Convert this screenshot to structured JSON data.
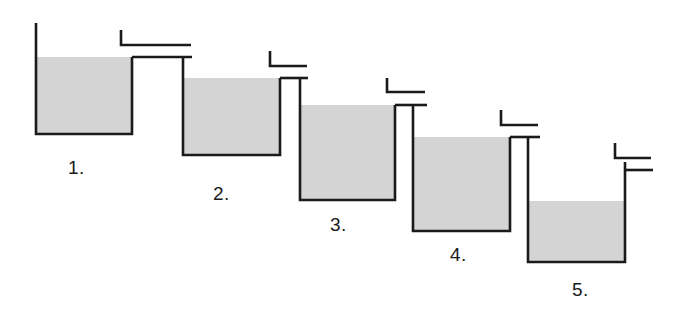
{
  "diagram": {
    "kind": "schematic-line-drawing",
    "background_color": "#ffffff",
    "line_color": "#1a1a1a",
    "fill_color": "#d4d4d4",
    "line_width": 2.6,
    "canvas": {
      "width": 684,
      "height": 314
    },
    "tanks": [
      {
        "id": "tank-1",
        "label": "1.",
        "label_x": 68,
        "label_y": 174,
        "body": {
          "left": 36,
          "right": 132,
          "bottom": 134,
          "wall_top": 23
        },
        "fill": {
          "top": 57,
          "left": 37,
          "right": 131,
          "bottom": 133
        },
        "right_wall_top": 57,
        "inlet_weir": {
          "v_x": 121,
          "v_top": 30,
          "v_bottom": 45,
          "h_left": 121,
          "h_right": 191,
          "h_y": 45
        },
        "outlet_lip": {
          "y": 57,
          "x_left": 132,
          "x_right": 192
        }
      },
      {
        "id": "tank-2",
        "label": "2.",
        "label_x": 213,
        "label_y": 200,
        "body": {
          "left": 183,
          "right": 280,
          "bottom": 155,
          "wall_top": 57
        },
        "fill": {
          "top": 78,
          "left": 184,
          "right": 279,
          "bottom": 154
        },
        "right_wall_top": 78,
        "inlet_weir": {
          "v_x": 270,
          "v_top": 51,
          "v_bottom": 66,
          "h_left": 270,
          "h_right": 307,
          "h_y": 66
        },
        "outlet_lip": {
          "y": 78,
          "x_left": 280,
          "x_right": 308
        }
      },
      {
        "id": "tank-3",
        "label": "3.",
        "label_x": 330,
        "label_y": 231,
        "body": {
          "left": 300,
          "right": 395,
          "bottom": 200,
          "wall_top": 78
        },
        "fill": {
          "top": 105,
          "left": 301,
          "right": 394,
          "bottom": 199
        },
        "right_wall_top": 105,
        "inlet_weir": {
          "v_x": 387,
          "v_top": 78,
          "v_bottom": 92,
          "h_left": 387,
          "h_right": 425,
          "h_y": 92
        },
        "outlet_lip": {
          "y": 105,
          "x_left": 395,
          "x_right": 427
        }
      },
      {
        "id": "tank-4",
        "label": "4.",
        "label_x": 450,
        "label_y": 261,
        "body": {
          "left": 413,
          "right": 510,
          "bottom": 231,
          "wall_top": 105
        },
        "fill": {
          "top": 137,
          "left": 414,
          "right": 509,
          "bottom": 230
        },
        "right_wall_top": 137,
        "inlet_weir": {
          "v_x": 501,
          "v_top": 110,
          "v_bottom": 125,
          "h_left": 501,
          "h_right": 538,
          "h_y": 125
        },
        "outlet_lip": {
          "y": 137,
          "x_left": 510,
          "x_right": 540
        }
      },
      {
        "id": "tank-5",
        "label": "5.",
        "label_x": 572,
        "label_y": 296,
        "body": {
          "left": 528,
          "right": 625,
          "bottom": 262,
          "wall_top": 137
        },
        "fill": {
          "top": 201,
          "left": 529,
          "right": 624,
          "bottom": 261
        },
        "right_wall_top": 162,
        "inlet_weir": {
          "v_x": 615,
          "v_top": 143,
          "v_bottom": 158,
          "h_left": 615,
          "h_right": 651,
          "h_y": 158
        },
        "outlet_lip": {
          "y": 170,
          "x_left": 625,
          "x_right": 653
        }
      }
    ]
  }
}
